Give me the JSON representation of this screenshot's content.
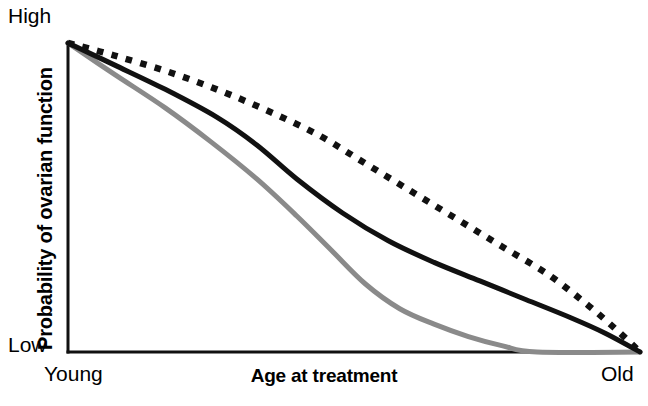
{
  "axes": {
    "y_title": "Probability of ovarian function",
    "y_tick_high": "High",
    "y_tick_low": "Low",
    "x_title": "Age at treatment",
    "x_tick_left": "Young",
    "x_tick_right": "Old"
  },
  "colors": {
    "axis": "#111111",
    "series_black_solid": "#111111",
    "series_black_dotted": "#111111",
    "series_gray_solid": "#8a8a8a",
    "background": "#ffffff"
  },
  "chart_data": {
    "type": "line",
    "title": "",
    "subtitle": "",
    "xlabel": "Age at treatment",
    "ylabel": "Probability of ovarian function",
    "xlim": [
      0,
      100
    ],
    "ylim": [
      0,
      100
    ],
    "grid": false,
    "legend": "none",
    "xticks": [
      0,
      100
    ],
    "xticklabels": [
      "Young",
      "Old"
    ],
    "yticks": [
      0,
      100
    ],
    "yticklabels": [
      "Low",
      "High"
    ],
    "annotations": [],
    "series": [
      {
        "name": "Low gonadotoxicity (dotted)",
        "style": "dotted",
        "color": "#111111",
        "x": [
          0,
          8,
          17,
          26,
          35,
          44,
          52,
          60,
          68,
          76,
          84,
          91,
          96,
          100
        ],
        "values": [
          100,
          96,
          91,
          85,
          78,
          70,
          61,
          52,
          43,
          34,
          25,
          15,
          7,
          0
        ]
      },
      {
        "name": "Intermediate gonadotoxicity (solid black)",
        "style": "solid",
        "color": "#111111",
        "x": [
          0,
          8,
          17,
          26,
          33,
          40,
          48,
          56,
          64,
          72,
          80,
          88,
          94,
          100
        ],
        "values": [
          100,
          93,
          85,
          76,
          67,
          56,
          45,
          36,
          29,
          23,
          17,
          11,
          6,
          0
        ]
      },
      {
        "name": "High gonadotoxicity (solid gray)",
        "style": "solid",
        "color": "#8a8a8a",
        "x": [
          0,
          8,
          17,
          25,
          33,
          40,
          46,
          52,
          58,
          64,
          70,
          76,
          82,
          100
        ],
        "values": [
          100,
          90,
          79,
          68,
          56,
          44,
          33,
          22,
          14,
          9,
          5,
          2,
          0,
          0
        ]
      }
    ]
  }
}
